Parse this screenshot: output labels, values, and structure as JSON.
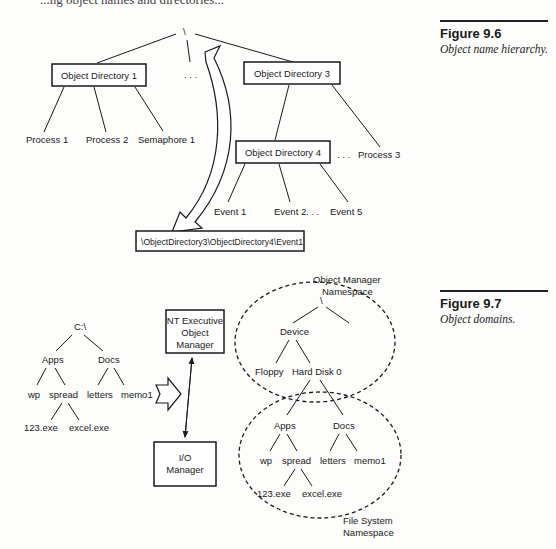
{
  "page": {
    "top_text_fragment": "...ng object names and directories..."
  },
  "figure_9_6": {
    "title": "Figure 9.6",
    "caption": "Object name hierarchy.",
    "root": "\\",
    "ellipsis": ". . .",
    "directories": [
      "Object Directory 1",
      "Object Directory 3",
      "Object Directory 4"
    ],
    "dir1_children": [
      "Process 1",
      "Process 2",
      "Semaphore 1"
    ],
    "dir3_extra_child": "Process 3",
    "dir4_children": [
      "Event 1",
      "Event 2",
      "Event 5"
    ],
    "path_box": "\\ObjectDirectory3\\ObjectDirectory4\\Event1"
  },
  "figure_9_7": {
    "title": "Figure 9.7",
    "caption": "Object domains.",
    "left_tree": {
      "root": "C:\\",
      "level1": [
        "Apps",
        "Docs"
      ],
      "apps_children": [
        "wp",
        "spread"
      ],
      "docs_children": [
        "letters",
        "memo1"
      ],
      "spread_children": [
        "123.exe",
        "excel.exe"
      ]
    },
    "object_manager_box": [
      "NT Executive",
      "Object",
      "Manager"
    ],
    "io_manager_box": [
      "I/O",
      "Manager"
    ],
    "om_namespace_label": [
      "Object Manager",
      "Namespace"
    ],
    "om_tree": {
      "root": "\\",
      "device": "Device",
      "device_children": [
        "Floppy",
        "Hard Disk 0"
      ]
    },
    "fs_tree": {
      "level1": [
        "Apps",
        "Docs"
      ],
      "apps_children": [
        "wp",
        "spread"
      ],
      "docs_children": [
        "letters",
        "memo1"
      ],
      "spread_children": [
        "123.exe",
        "excel.exe"
      ]
    },
    "fs_namespace_label": [
      "File System",
      "Namespace"
    ]
  }
}
